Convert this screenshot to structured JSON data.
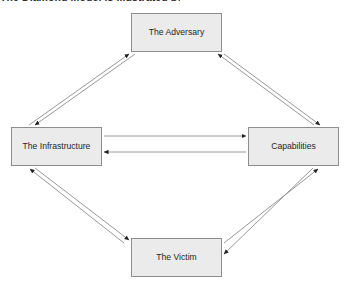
{
  "caption": {
    "fragment_text": "The Diamond Model is illustrated below:"
  },
  "diagram": {
    "type": "node-link-diagram",
    "background_color": "#ffffff",
    "node_fill_color": "#ebebeb",
    "node_border_color": "#8e8e8e",
    "edge_color": "#808080",
    "arrowhead_color": "#222222",
    "nodes": [
      {
        "id": "adversary",
        "label": "The Adversary",
        "position": "top"
      },
      {
        "id": "infrastructure",
        "label": "The Infrastructure",
        "position": "left"
      },
      {
        "id": "capabilities",
        "label": "Capabilities",
        "position": "right"
      },
      {
        "id": "victim",
        "label": "The Victim",
        "position": "bottom"
      }
    ],
    "edges": [
      {
        "from": "infrastructure",
        "to": "adversary",
        "style": "arrow"
      },
      {
        "from": "adversary",
        "to": "infrastructure",
        "style": "arrow"
      },
      {
        "from": "adversary",
        "to": "capabilities",
        "style": "arrow"
      },
      {
        "from": "capabilities",
        "to": "adversary",
        "style": "arrow"
      },
      {
        "from": "infrastructure",
        "to": "capabilities",
        "style": "arrow"
      },
      {
        "from": "capabilities",
        "to": "infrastructure",
        "style": "arrow"
      },
      {
        "from": "infrastructure",
        "to": "victim",
        "style": "arrow"
      },
      {
        "from": "victim",
        "to": "infrastructure",
        "style": "arrow"
      },
      {
        "from": "victim",
        "to": "capabilities",
        "style": "arrow"
      },
      {
        "from": "capabilities",
        "to": "victim",
        "style": "arrow"
      }
    ]
  }
}
